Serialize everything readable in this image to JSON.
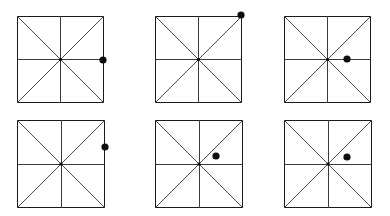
{
  "figure": {
    "background_color": "#ffffff",
    "width": 390,
    "height": 216,
    "rows": 2,
    "columns": 3,
    "shape_name": "square-with-eight-spokes",
    "line_color": "#3a3a3a",
    "outline_color": "#1a1a1a",
    "dot_color": "#0d0d0d",
    "dot_radius": 3.6,
    "panels": [
      {
        "id": "panel-1",
        "label": "panel-1",
        "square": {
          "x": 17,
          "y": 16,
          "size": 87
        },
        "center": {
          "x": 60.5,
          "y": 59.5
        },
        "dot": {
          "x": 103,
          "y": 60
        },
        "dot_position_name": "right-edge-midline",
        "dot_angle_deg": 0,
        "dot_radius_from_center": 42.5
      },
      {
        "id": "panel-2",
        "label": "panel-2",
        "square": {
          "x": 155,
          "y": 16,
          "size": 87
        },
        "center": {
          "x": 198.5,
          "y": 59.5
        },
        "dot": {
          "x": 241,
          "y": 15
        },
        "dot_position_name": "top-right-corner",
        "dot_angle_deg": 45,
        "dot_radius_from_center": 61.5
      },
      {
        "id": "panel-3",
        "label": "panel-3",
        "square": {
          "x": 284,
          "y": 16,
          "size": 87
        },
        "center": {
          "x": 327.5,
          "y": 59.5
        },
        "dot": {
          "x": 347,
          "y": 59
        },
        "dot_position_name": "inside-right-of-center-on-midline",
        "dot_angle_deg": 0,
        "dot_radius_from_center": 19.5
      },
      {
        "id": "panel-4",
        "label": "panel-4",
        "square": {
          "x": 17,
          "y": 120,
          "size": 88
        },
        "center": {
          "x": 61,
          "y": 171.5
        },
        "dot": {
          "x": 105,
          "y": 147
        },
        "dot_position_name": "right-edge-above-midline",
        "dot_angle_deg": 29,
        "dot_radius_from_center": 50.3
      },
      {
        "id": "panel-5",
        "label": "panel-5",
        "square": {
          "x": 155,
          "y": 120,
          "size": 88
        },
        "center": {
          "x": 199,
          "y": 171.5
        },
        "dot": {
          "x": 216,
          "y": 156
        },
        "dot_position_name": "inside-upper-right-quadrant",
        "dot_angle_deg": 42,
        "dot_radius_from_center": 23
      },
      {
        "id": "panel-6",
        "label": "panel-6",
        "square": {
          "x": 284,
          "y": 120,
          "size": 88
        },
        "center": {
          "x": 328,
          "y": 171.5
        },
        "dot": {
          "x": 347,
          "y": 157
        },
        "dot_position_name": "inside-upper-right-quadrant",
        "dot_angle_deg": 38,
        "dot_radius_from_center": 24
      }
    ]
  }
}
